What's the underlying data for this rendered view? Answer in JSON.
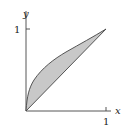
{
  "diagram": {
    "type": "region-between-curves",
    "axes": {
      "x_label": "x",
      "y_label": "y",
      "x_tick": "1",
      "y_tick": "1"
    },
    "curves": [
      {
        "name": "upper",
        "equation": "y = sqrt(x)"
      },
      {
        "name": "lower",
        "equation": "y = x"
      }
    ],
    "region": {
      "from": 0,
      "to": 1,
      "fill": "#c8c8c8",
      "stroke": "#444444"
    }
  }
}
